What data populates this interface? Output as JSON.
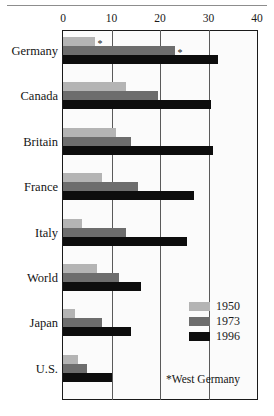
{
  "chart_data": {
    "type": "bar",
    "orientation": "horizontal",
    "title": "",
    "xlabel": "",
    "ylabel": "",
    "xlim": [
      0,
      40
    ],
    "xticks": [
      0,
      10,
      20,
      30,
      40
    ],
    "grid": true,
    "legend_position": "inside-lower-right",
    "categories": [
      "Germany",
      "Canada",
      "Britain",
      "France",
      "Italy",
      "World",
      "Japan",
      "U.S."
    ],
    "series": [
      {
        "name": "1950",
        "color": "#b4b4b4",
        "values": [
          6.5,
          13.0,
          11.0,
          8.0,
          4.0,
          7.0,
          2.5,
          3.0
        ]
      },
      {
        "name": "1973",
        "color": "#6d6d6d",
        "values": [
          23.0,
          19.5,
          14.0,
          15.5,
          13.0,
          11.5,
          8.0,
          5.0
        ]
      },
      {
        "name": "1996",
        "color": "#0d0d0d",
        "values": [
          32.0,
          30.5,
          31.0,
          27.0,
          25.5,
          16.0,
          14.0,
          10.0
        ]
      }
    ],
    "annotations": [
      {
        "category": "Germany",
        "series": "1950",
        "marker": "*"
      },
      {
        "category": "Germany",
        "series": "1973",
        "marker": "*"
      }
    ],
    "footnote": "*West Germany"
  },
  "axis": {
    "ticks": [
      {
        "label": "0",
        "value": 0
      },
      {
        "label": "10",
        "value": 10
      },
      {
        "label": "20",
        "value": 20
      },
      {
        "label": "30",
        "value": 30
      },
      {
        "label": "40",
        "value": 40
      }
    ]
  },
  "legend": {
    "items": [
      {
        "label": "1950",
        "color": "#b4b4b4"
      },
      {
        "label": "1973",
        "color": "#6d6d6d"
      },
      {
        "label": "1996",
        "color": "#0d0d0d"
      }
    ]
  },
  "footnote": {
    "text": "*West Germany"
  }
}
